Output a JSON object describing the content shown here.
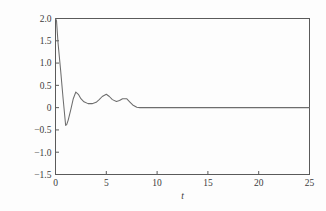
{
  "chart_data": {
    "type": "line",
    "title": "",
    "subtitle": "",
    "xlabel": "t",
    "ylabel": "状态 x₁(t)",
    "ylabel_prefix": "状态",
    "ylabel_symbol": "x",
    "ylabel_subscript": "1",
    "ylabel_suffix": "(t)",
    "xlim": [
      0,
      25
    ],
    "ylim": [
      -1.5,
      2.0
    ],
    "xticks": [
      0,
      5,
      10,
      15,
      20,
      25
    ],
    "xticklabels": [
      "0",
      "5",
      "10",
      "15",
      "20",
      "25"
    ],
    "yticks": [
      -1.5,
      -1.0,
      -0.5,
      0,
      0.5,
      1.0,
      1.5,
      2.0
    ],
    "yticklabels": [
      "-1.5",
      "-1.0",
      "-0.5",
      "0",
      "0.5",
      "1.0",
      "1.5",
      "2.0"
    ],
    "grid": false,
    "legend": false,
    "legend_position": "none",
    "line_color": "#6d6d6d",
    "frame_color": "#5a5a5a",
    "background_color": "#fdfdfd",
    "series": [
      {
        "name": "x1(t)",
        "x": [
          0.0,
          0.1,
          0.25,
          0.5,
          0.75,
          1.0,
          1.1,
          1.25,
          1.5,
          1.75,
          2.0,
          2.25,
          2.5,
          2.8,
          3.2,
          3.6,
          4.0,
          4.3,
          4.6,
          5.0,
          5.3,
          5.6,
          6.0,
          6.3,
          6.6,
          7.0,
          7.3,
          7.6,
          8.0,
          8.3,
          8.6,
          9.0,
          10.0,
          12.0,
          14.0,
          16.0,
          18.0,
          20.0,
          22.0,
          25.0
        ],
        "y": [
          2.0,
          1.95,
          1.45,
          0.85,
          0.2,
          -0.4,
          -0.38,
          -0.28,
          -0.05,
          0.2,
          0.35,
          0.3,
          0.2,
          0.13,
          0.09,
          0.09,
          0.12,
          0.18,
          0.25,
          0.3,
          0.25,
          0.18,
          0.14,
          0.16,
          0.2,
          0.2,
          0.13,
          0.06,
          0.01,
          0.0,
          0.0,
          0.0,
          0.0,
          0.0,
          0.0,
          0.0,
          0.0,
          0.0,
          0.0,
          0.0
        ]
      }
    ],
    "annotations": []
  }
}
